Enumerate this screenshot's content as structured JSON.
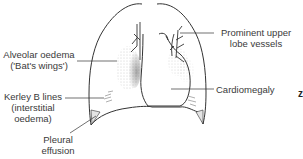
{
  "diagram": {
    "labels": {
      "alveolar_oedema": {
        "line1": "Alveolar oedema",
        "line2": "('Bat's wings')"
      },
      "prominent_vessels": {
        "line1": "Prominent upper",
        "line2": "lobe vessels"
      },
      "kerley_b": {
        "line1": "Kerley B lines",
        "line2": "(interstitial",
        "line3": "oedema)"
      },
      "pleural_effusion": {
        "line1": "Pleural",
        "line2": "effusion"
      },
      "cardiomegaly": {
        "line1": "Cardiomegaly"
      }
    },
    "edge_glyph": "z",
    "colors": {
      "line": "#333333",
      "text": "#3a3a3a",
      "shading": "#777777",
      "background": "#ffffff"
    }
  }
}
